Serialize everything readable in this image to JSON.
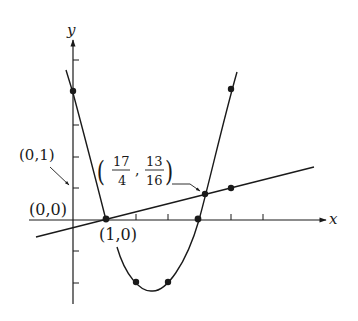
{
  "diagram": {
    "type": "graph-of-functions",
    "axes": {
      "x_label": "x",
      "y_label": "y"
    },
    "functions": [
      {
        "name": "parabola",
        "expression": "y = (x-1)(x-4)",
        "plotted_points": [
          [
            0,
            4
          ],
          [
            1,
            0
          ],
          [
            2,
            -2
          ],
          [
            3,
            -2
          ],
          [
            4,
            0
          ],
          [
            5,
            4
          ]
        ]
      },
      {
        "name": "line",
        "expression": "y = (x-1)/4",
        "plotted_points": [
          [
            1,
            0
          ],
          [
            5,
            1
          ]
        ]
      }
    ],
    "annotations": {
      "y_intercept_label": "(0,1)",
      "origin_label": "(0,0)",
      "root_label": "(1,0)",
      "intersection": {
        "x_num": "17",
        "x_den": "4",
        "y_num": "13",
        "y_den": "16"
      }
    },
    "colors": {
      "ink": "#1a1a1a",
      "background": "#ffffff"
    }
  }
}
